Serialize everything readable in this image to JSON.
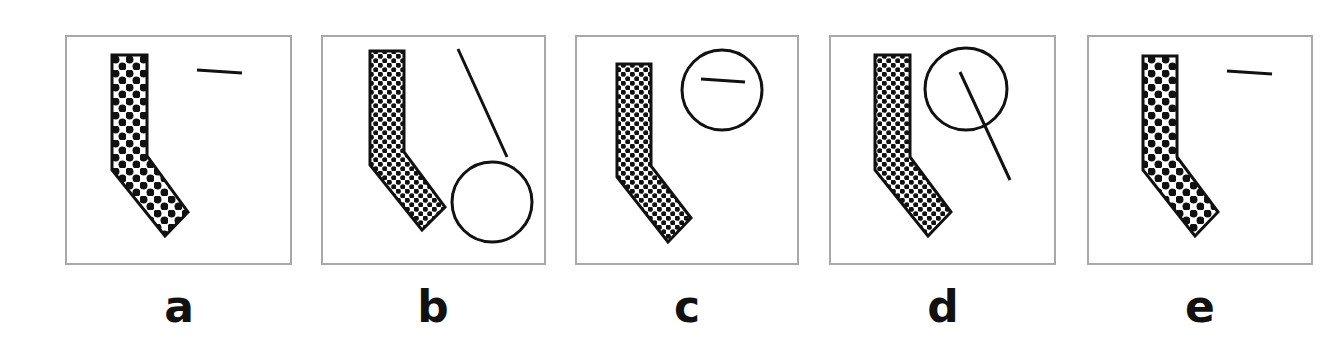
{
  "figure": {
    "type": "visual-reasoning-options",
    "stroke_color": "#111111",
    "frame_color": "#a8a8a8",
    "background": "#ffffff"
  },
  "options": [
    {
      "label": "a",
      "frame": {
        "x": 66,
        "y": 36,
        "w": 225,
        "h": 228
      },
      "l_shape": {
        "pattern": "coarse-dots",
        "points": "112,55 147,55 147,156 188,212 165,236 112,170"
      },
      "line": {
        "x1": 197,
        "y1": 70,
        "x2": 242,
        "y2": 73
      },
      "circle": null
    },
    {
      "label": "b",
      "frame": {
        "x": 322,
        "y": 36,
        "w": 223,
        "h": 228
      },
      "l_shape": {
        "pattern": "fine-dots",
        "points": "370,51 404,51 404,152 445,207 422,230 370,165"
      },
      "line": {
        "x1": 458,
        "y1": 49,
        "x2": 507,
        "y2": 157
      },
      "circle": {
        "cx": 492,
        "cy": 202,
        "r": 40
      }
    },
    {
      "label": "c",
      "frame": {
        "x": 576,
        "y": 36,
        "w": 222,
        "h": 228
      },
      "l_shape": {
        "pattern": "fine-dots",
        "points": "617,64 651,64 651,166 691,218 668,242 617,177"
      },
      "line": {
        "x1": 701,
        "y1": 79,
        "x2": 745,
        "y2": 82
      },
      "circle": {
        "cx": 722,
        "cy": 90,
        "r": 40
      }
    },
    {
      "label": "d",
      "frame": {
        "x": 830,
        "y": 36,
        "w": 225,
        "h": 228
      },
      "l_shape": {
        "pattern": "fine-dots",
        "points": "875,55 910,55 910,157 951,212 928,236 875,170"
      },
      "line": {
        "x1": 960,
        "y1": 72,
        "x2": 1010,
        "y2": 180
      },
      "circle": {
        "cx": 966,
        "cy": 89,
        "r": 41
      }
    },
    {
      "label": "e",
      "frame": {
        "x": 1088,
        "y": 36,
        "w": 224,
        "h": 228
      },
      "l_shape": {
        "pattern": "coarse-dots",
        "points": "1143,56 1177,56 1177,157 1218,212 1195,236 1143,170"
      },
      "line": {
        "x1": 1227,
        "y1": 71,
        "x2": 1272,
        "y2": 74
      },
      "circle": null
    }
  ]
}
